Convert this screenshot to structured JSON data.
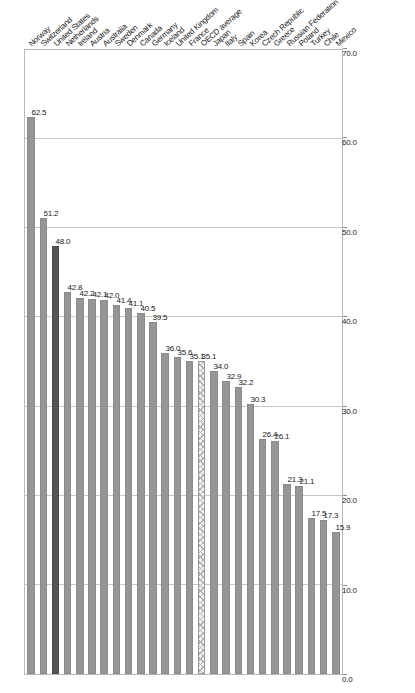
{
  "chart_data": {
    "type": "bar",
    "orientation": "horizontal",
    "title": "",
    "subtitle": "",
    "xlabel": "",
    "ylabel": "",
    "xlim": [
      0,
      70
    ],
    "ylim": [
      0,
      70
    ],
    "grid": true,
    "legend": null,
    "axis_ticks": [
      "0.0",
      "10.0",
      "20.0",
      "30.0",
      "40.0",
      "50.0",
      "60.0",
      "70.0"
    ],
    "axis_tick_values": [
      0,
      10,
      20,
      30,
      40,
      50,
      60,
      70
    ],
    "categories": [
      "Norway",
      "Switzerland",
      "United States",
      "Netherlands",
      "Ireland",
      "Austria",
      "Australia",
      "Sweden",
      "Denmark",
      "Canada",
      "Germany",
      "Iceland",
      "United Kingdom",
      "France",
      "OECD average",
      "Japan",
      "Italy",
      "Spain",
      "Korea",
      "Czech Republic",
      "Greece",
      "Russian Federation",
      "Poland",
      "Turkey",
      "Chile",
      "Mexico"
    ],
    "values": [
      62.5,
      51.2,
      48.0,
      42.8,
      42.2,
      42.1,
      42.0,
      41.4,
      41.1,
      40.5,
      39.5,
      36.0,
      35.6,
      35.1,
      35.1,
      34.0,
      32.9,
      32.2,
      30.3,
      26.4,
      26.1,
      21.3,
      21.1,
      17.5,
      17.3,
      15.9
    ],
    "value_labels": [
      "62.5",
      "51.2",
      "48.0",
      "42.8",
      "42.2",
      "42.1",
      "42.0",
      "41.4",
      "41.1",
      "40.5",
      "39.5",
      "36.0",
      "35.6",
      "35.1",
      "35.1",
      "34.0",
      "32.9",
      "32.2",
      "30.3",
      "26.4",
      "26.1",
      "21.3",
      "21.1",
      "17.5",
      "17.3",
      "15.9"
    ],
    "bar_styles": [
      "normal",
      "normal",
      "highlight",
      "normal",
      "normal",
      "normal",
      "normal",
      "normal",
      "normal",
      "normal",
      "normal",
      "normal",
      "normal",
      "normal",
      "hatched",
      "normal",
      "normal",
      "normal",
      "normal",
      "normal",
      "normal",
      "normal",
      "normal",
      "normal",
      "normal",
      "normal"
    ]
  },
  "colors": {
    "bar_default": "#969696",
    "bar_highlight": "#555555",
    "bar_hatched": "#f2f2f2",
    "gridline": "#c9c9c9",
    "axis": "#b9b9b9",
    "text": "#1a1a1a",
    "background": "#ffffff"
  }
}
